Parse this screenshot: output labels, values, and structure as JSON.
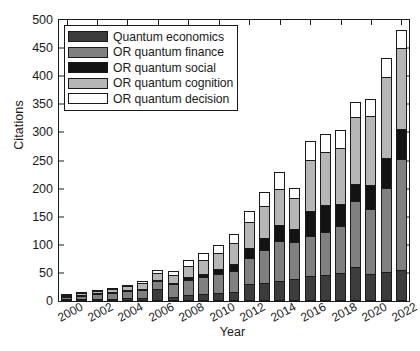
{
  "chart_data": {
    "type": "bar",
    "stacked": true,
    "title": "",
    "xlabel": "Year",
    "ylabel": "Citations",
    "ylim": [
      0,
      500
    ],
    "ytick_step": 50,
    "yticks": [
      0,
      50,
      100,
      150,
      200,
      250,
      300,
      350,
      400,
      450,
      500
    ],
    "xlim": [
      2000,
      2022
    ],
    "xticks": [
      2000,
      2002,
      2004,
      2006,
      2008,
      2010,
      2012,
      2014,
      2016,
      2018,
      2020,
      2022
    ],
    "grid": false,
    "legend_position": "upper-left",
    "categories": [
      "2000",
      "2001",
      "2002",
      "2003",
      "2004",
      "2005",
      "2006",
      "2007",
      "2008",
      "2009",
      "2010",
      "2011",
      "2012",
      "2013",
      "2014",
      "2015",
      "2016",
      "2017",
      "2018",
      "2019",
      "2020",
      "2021",
      "2022"
    ],
    "series": [
      {
        "name": "Quantum economics",
        "color": "#3c3c3c",
        "values": [
          2,
          3,
          4,
          4,
          5,
          6,
          22,
          8,
          10,
          12,
          14,
          16,
          30,
          32,
          36,
          40,
          44,
          46,
          50,
          60,
          48,
          52,
          55
        ]
      },
      {
        "name": "OR quantum finance",
        "color": "#808080",
        "values": [
          6,
          8,
          10,
          12,
          14,
          16,
          16,
          24,
          30,
          32,
          36,
          40,
          48,
          60,
          72,
          66,
          74,
          78,
          86,
          120,
          118,
          150,
          200
        ]
      },
      {
        "name": "OR quantum social",
        "color": "#131313",
        "values": [
          1,
          1,
          2,
          2,
          2,
          3,
          3,
          4,
          6,
          8,
          10,
          14,
          20,
          24,
          30,
          26,
          46,
          50,
          40,
          32,
          44,
          56,
          55
        ]
      },
      {
        "name": "OR quantum cognition",
        "color": "#b6b6b6",
        "values": [
          3,
          4,
          6,
          7,
          9,
          11,
          13,
          16,
          22,
          26,
          30,
          38,
          48,
          58,
          66,
          56,
          92,
          96,
          102,
          120,
          124,
          146,
          145
        ]
      },
      {
        "name": "OR quantum decision",
        "color": "#ffffff",
        "values": [
          2,
          2,
          3,
          4,
          5,
          6,
          7,
          8,
          12,
          14,
          16,
          18,
          22,
          28,
          32,
          20,
          36,
          34,
          34,
          30,
          32,
          36,
          35
        ]
      }
    ],
    "totals": [
      14,
      18,
      25,
      29,
      35,
      42,
      61,
      60,
      80,
      92,
      106,
      126,
      168,
      202,
      236,
      208,
      292,
      304,
      312,
      362,
      366,
      440,
      490
    ]
  },
  "legend": {
    "items": [
      {
        "label": "Quantum economics"
      },
      {
        "label": "OR quantum finance"
      },
      {
        "label": "OR quantum social"
      },
      {
        "label": "OR quantum cognition"
      },
      {
        "label": "OR quantum decision"
      }
    ]
  },
  "axes": {
    "y_title": "Citations",
    "x_title": "Year"
  }
}
